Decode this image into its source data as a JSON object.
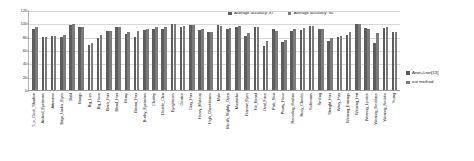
{
  "chart_data": {
    "type": "bar",
    "title": "",
    "xlabel": "",
    "ylabel": "",
    "ylim": [
      0,
      120
    ],
    "yticks": [
      0,
      20,
      40,
      60,
      80,
      100,
      120
    ],
    "grid": true,
    "legend_position": "right",
    "categories": [
      "5_o_Clock_Shadow",
      "Arched_Eyebrows",
      "Attractive",
      "Bags_Under_Eyes",
      "Bald",
      "Bangs",
      "Big_Lips",
      "Big_Nose",
      "Black_Hair",
      "Blond_Hair",
      "Blurry",
      "Brown_Hair",
      "Bushy_Eyebrows",
      "Chubby",
      "Double_Chin",
      "Eyeglasses",
      "Goatee",
      "Gray_Hair",
      "Heavy_Makeup",
      "High_Cheekbones",
      "Male",
      "Mouth_Slightly_Open",
      "Mustache",
      "Narrow_Eyes",
      "No_Beard",
      "Oval_Face",
      "Pale_Skin",
      "Pointy_Nose",
      "Receding_Hairline",
      "Rosy_Cheeks",
      "Sideburns",
      "Smiling",
      "Straight_Hair",
      "Wavy_Hair",
      "Wearing_Earrings",
      "Wearing_Hat",
      "Wearing_Lipstick",
      "Wearing_Necklace",
      "Wearing_Necktie",
      "Young"
    ],
    "series": [
      {
        "name": "Anet+Lnet[13]",
        "color": "#5d5d5d",
        "values": [
          91,
          79,
          81,
          79,
          98,
          95,
          68,
          78,
          88,
          95,
          84,
          80,
          90,
          91,
          92,
          99,
          95,
          97,
          90,
          87,
          98,
          92,
          95,
          81,
          95,
          66,
          91,
          72,
          89,
          90,
          96,
          92,
          73,
          80,
          82,
          99,
          93,
          71,
          93,
          87
        ]
      },
      {
        "name": "our method",
        "color": "#7b7b7b",
        "values": [
          94,
          80,
          81,
          82,
          99,
          95,
          70,
          83,
          88,
          94,
          87,
          89,
          92,
          94,
          95,
          99,
          96,
          98,
          91,
          87,
          96,
          93,
          96,
          85,
          94,
          74,
          89,
          75,
          91,
          93,
          96,
          92,
          78,
          81,
          87,
          99,
          92,
          85,
          95,
          87
        ]
      }
    ],
    "annotations": [
      {
        "id": "avg-accuracy-a",
        "text": "Average accuracy: 87"
      },
      {
        "id": "avg-accuracy-b",
        "text": "Average accuracy: 90"
      }
    ]
  },
  "axis": {
    "y_tick_labels": [
      "0",
      "20",
      "40",
      "60",
      "80",
      "100",
      "120"
    ]
  },
  "top_legend": {
    "items": [
      {
        "label": "Average accuracy: 87"
      },
      {
        "label": "Average accuracy: 90"
      }
    ]
  },
  "right_legend": {
    "items": [
      {
        "label": "Anet+Lnet[13]"
      },
      {
        "label": "our method"
      }
    ]
  }
}
